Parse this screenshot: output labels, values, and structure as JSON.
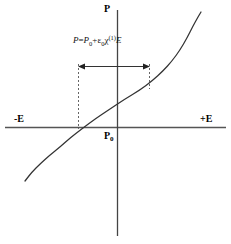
{
  "figure": {
    "background_color": "#ffffff",
    "line_color": "#000000",
    "axis_color": "#555555",
    "curve_color": "#333333",
    "dashed_color": "#666666"
  },
  "axes": {
    "vertical_label": "P",
    "horizontal_label_left": "-E",
    "horizontal_label_right": "+E",
    "origin_label": "P",
    "origin_label_sub": "0",
    "x_axis_y": 127,
    "y_axis_x": 117,
    "x_axis_start": 5,
    "x_axis_end": 226,
    "y_axis_top": 10,
    "y_axis_bottom": 236
  },
  "equation": {
    "full_text": "P = P0 + e0 x(1) E",
    "lhs": "P",
    "equals": "=",
    "p_term": "P",
    "p_term_sub": "0",
    "plus": "+",
    "epsilon": "ε",
    "epsilon_sub": "0",
    "chi": "χ",
    "chi_sup": "(1)",
    "field": "E"
  },
  "annotation": {
    "name": "linear-region-arrow",
    "description": "double-headed horizontal arrow spanning the linear region",
    "arrow_y": 66,
    "arrow_left_x": 78,
    "arrow_right_x": 150,
    "dash_left_x": 78,
    "dash_left_top": 66,
    "dash_left_bottom": 128,
    "dash_right_x": 149,
    "dash_right_top": 66,
    "dash_right_bottom": 88
  },
  "chart_data": {
    "type": "line",
    "title": "",
    "xlabel": "E",
    "ylabel": "P",
    "legend": [],
    "grid": false,
    "xlim": [
      -1,
      1
    ],
    "ylim": [
      -1,
      1
    ],
    "annotations": [
      {
        "text": "P = P0 + ε0χ(1)E",
        "x": 0.0,
        "y": 0.62
      },
      {
        "text": "-E",
        "x": -0.95,
        "y": 0.06
      },
      {
        "text": "+E",
        "x": 0.78,
        "y": 0.06
      },
      {
        "text": "P",
        "x": -0.06,
        "y": 1.0
      },
      {
        "text": "P0",
        "x": -0.06,
        "y": -0.07
      }
    ],
    "series": [
      {
        "name": "polarization",
        "comment": "S-shaped saturating/cubic curve through origin; pixel path points",
        "points_px": [
          [
            25,
            181
          ],
          [
            32,
            172
          ],
          [
            40,
            164
          ],
          [
            50,
            155
          ],
          [
            60,
            147
          ],
          [
            70,
            138
          ],
          [
            83,
            128
          ],
          [
            95,
            119
          ],
          [
            110,
            109
          ],
          [
            125,
            99
          ],
          [
            140,
            90
          ],
          [
            152,
            81
          ],
          [
            163,
            71
          ],
          [
            172,
            61
          ],
          [
            180,
            50
          ],
          [
            187,
            38
          ],
          [
            193,
            26
          ],
          [
            198,
            17
          ],
          [
            201,
            12
          ]
        ]
      }
    ]
  }
}
